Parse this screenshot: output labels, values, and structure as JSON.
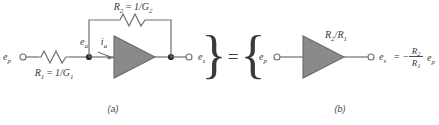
{
  "figure": {
    "type": "circuit-diagram",
    "background_color": "#ffffff",
    "wire_color": "#6e6e6e",
    "amp_fill_color": "#8a8a8a",
    "amp_stroke_color": "#6a6a6a",
    "text_color": "#3a3a3a"
  },
  "panel_a": {
    "caption": "(a)",
    "input_terminal_label": "e",
    "input_terminal_sub": "p",
    "node_label": "e",
    "node_sub": "a",
    "current_label": "i",
    "current_sub": "a",
    "output_terminal_label": "e",
    "output_terminal_sub": "s",
    "input_resistor": {
      "name": "R",
      "sub": "1",
      "equals": "=",
      "value_num": "1/G",
      "value_sub": "1"
    },
    "feedback_resistor": {
      "name": "R",
      "sub": "2",
      "equals": "=",
      "value_num": "1/G",
      "value_sub": "2"
    }
  },
  "equality": {
    "left_brace": "}",
    "equals_sign": "=",
    "right_brace": "{"
  },
  "panel_b": {
    "caption": "(b)",
    "input_terminal_label": "e",
    "input_terminal_sub": "p",
    "gain_label_num": "R",
    "gain_label_num_sub": "2",
    "gain_label_slash": "/R",
    "gain_label_den_sub": "1",
    "output_terminal_label": "e",
    "output_terminal_sub": "s",
    "output_equation": {
      "equals": "=",
      "minus": "−",
      "numerator": "R",
      "numerator_sub": "2",
      "denominator": "R",
      "denominator_sub": "1",
      "variable": "e",
      "variable_sub": "p"
    }
  }
}
